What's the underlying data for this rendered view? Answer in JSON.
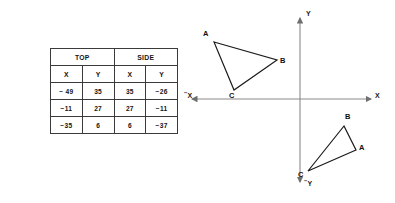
{
  "table": {
    "group_headers": [
      {
        "label": "TOP",
        "span": 2
      },
      {
        "label": "SIDE",
        "span": 2
      }
    ],
    "column_headers": [
      "X",
      "Y",
      "X",
      "Y"
    ],
    "rows": [
      [
        "− 49",
        "35",
        "35",
        "−26"
      ],
      [
        "−11",
        "27",
        "27",
        "−11"
      ],
      [
        "−35",
        "6",
        "6",
        "−37"
      ]
    ]
  },
  "axes": {
    "x_positive_label": "X",
    "x_negative_label": "X",
    "y_positive_label": "Y",
    "y_negative_label": "Y",
    "negative_sign": "−",
    "origin": {
      "x": 300,
      "y": 99
    },
    "line_color": "#8a8a8a"
  },
  "triangles": [
    {
      "name": "upper-left-triangle",
      "quadrant": "second",
      "vertices": [
        {
          "label": "A",
          "x": 214,
          "y": 42
        },
        {
          "label": "B",
          "x": 277,
          "y": 60
        },
        {
          "label": "C",
          "x": 234,
          "y": 90
        }
      ],
      "labels": [
        {
          "label": "A",
          "x": 203,
          "y": 32
        },
        {
          "label": "B",
          "x": 281,
          "y": 58
        },
        {
          "label": "C",
          "x": 231,
          "y": 93
        }
      ]
    },
    {
      "name": "lower-right-triangle",
      "quadrant": "fourth",
      "vertices": [
        {
          "label": "B",
          "x": 344,
          "y": 126
        },
        {
          "label": "A",
          "x": 356,
          "y": 150
        },
        {
          "label": "C",
          "x": 308,
          "y": 171
        }
      ],
      "labels": [
        {
          "label": "B",
          "x": 346,
          "y": 116
        },
        {
          "label": "A",
          "x": 360,
          "y": 146
        },
        {
          "label": "C",
          "x": 300,
          "y": 172
        }
      ]
    }
  ]
}
